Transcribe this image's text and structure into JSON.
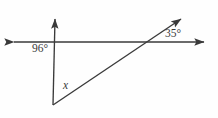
{
  "figure": {
    "type": "geometry-diagram",
    "background_color": "#fefefe",
    "stroke_color": "#3a3a3a",
    "width": 218,
    "height": 118,
    "labels": {
      "angle_left": "96°",
      "angle_right": "35°",
      "angle_unknown": "x"
    },
    "elements": {
      "horizontal_line_name": "horizontal-line",
      "steep_ray_name": "steep-ray",
      "diagonal_ray_name": "diagonal-ray"
    },
    "geometry": {
      "horizontal_line": {
        "x1": 8,
        "y1": 42,
        "x2": 210,
        "y2": 42
      },
      "steep_ray": {
        "x1": 53,
        "y1": 105,
        "x2": 53,
        "y2": 14
      },
      "diagonal_ray": {
        "x1": 53,
        "y1": 105,
        "x2": 186,
        "y2": 15
      },
      "vertex": {
        "x": 53,
        "y": 105
      },
      "intersection_left": {
        "x": 56,
        "y": 42
      },
      "intersection_right": {
        "x": 144,
        "y": 42
      }
    }
  }
}
